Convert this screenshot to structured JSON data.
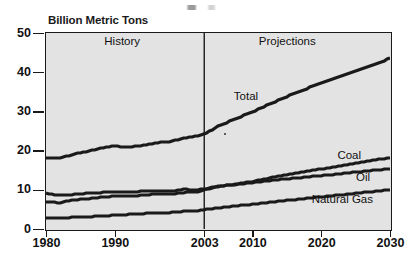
{
  "chart_data": {
    "type": "line",
    "title": "",
    "ylabel": "Billion Metric Tons",
    "xlabel": "",
    "ylim": [
      0,
      50
    ],
    "xlim": [
      1980,
      2030
    ],
    "yticks": [
      0,
      10,
      20,
      30,
      40,
      50
    ],
    "xticks": [
      1980,
      1990,
      2003,
      2010,
      2020,
      2030
    ],
    "grid": false,
    "legend_position": "inline-annotations",
    "annotations": [
      {
        "text": "History",
        "x": 1991,
        "y": 47.5
      },
      {
        "text": "Projections",
        "x": 2015,
        "y": 47.5
      },
      {
        "text": "Total",
        "x": 2009,
        "y": 33.5
      },
      {
        "text": "Coal",
        "x": 2024,
        "y": 18.5
      },
      {
        "text": "Oil",
        "x": 2026,
        "y": 13.0
      },
      {
        "text": "Natural Gas",
        "x": 2023,
        "y": 7.2
      }
    ],
    "divider": {
      "x": 2003,
      "label_left": "History",
      "label_right": "Projections"
    },
    "x": [
      1980,
      1982,
      1984,
      1986,
      1988,
      1990,
      1991,
      1992,
      1994,
      1996,
      1998,
      2000,
      2002,
      2003,
      2005,
      2010,
      2015,
      2020,
      2025,
      2030
    ],
    "series": [
      {
        "name": "Total",
        "values": [
          18.0,
          18.0,
          19.1,
          19.8,
          20.6,
          21.2,
          21.0,
          20.9,
          21.3,
          22.0,
          22.3,
          23.2,
          23.7,
          24.2,
          26.2,
          29.9,
          33.8,
          37.3,
          40.4,
          43.5
        ]
      },
      {
        "name": "Coal",
        "values": [
          6.9,
          6.7,
          7.4,
          7.7,
          8.1,
          8.4,
          8.4,
          8.4,
          8.6,
          9.0,
          8.9,
          9.3,
          9.5,
          10.0,
          10.8,
          12.1,
          13.9,
          15.3,
          16.8,
          18.2
        ]
      },
      {
        "name": "Oil",
        "values": [
          9.1,
          8.6,
          8.8,
          9.1,
          9.3,
          9.4,
          9.3,
          9.4,
          9.6,
          9.8,
          9.6,
          10.1,
          10.0,
          10.2,
          10.9,
          11.8,
          12.8,
          13.6,
          14.5,
          15.4
        ]
      },
      {
        "name": "Natural Gas",
        "values": [
          2.8,
          2.8,
          3.0,
          3.1,
          3.3,
          3.5,
          3.6,
          3.7,
          3.9,
          4.1,
          4.2,
          4.5,
          4.7,
          4.9,
          5.4,
          6.3,
          7.3,
          8.2,
          9.1,
          10.0
        ]
      }
    ]
  },
  "colors": {
    "plot_background": "#e3e3e3",
    "axis": "#1a1a1a",
    "line": "#1a1a1a"
  },
  "smudge": {
    "name": "scan-artifact"
  }
}
